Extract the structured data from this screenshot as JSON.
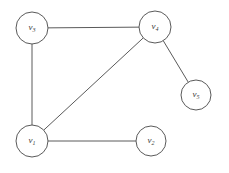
{
  "figure": {
    "type": "undirected-graph-diagram",
    "background_color": "#ffffff",
    "stroke_color": "#5a5a5a",
    "label_color": "#3a3a3a",
    "width": 229,
    "height": 173
  },
  "chart_data": {
    "type": "diagram",
    "title": "",
    "xlabel": "",
    "ylabel": "",
    "graph_kind": "undirected simple graph",
    "node_count": 5,
    "edge_count": 5,
    "nodes": [
      {
        "id": "v1",
        "label": "v",
        "subscript": "1",
        "cx": 32,
        "cy": 141,
        "r": 16
      },
      {
        "id": "v2",
        "label": "v",
        "subscript": "2",
        "cx": 151,
        "cy": 141,
        "r": 15
      },
      {
        "id": "v3",
        "label": "v",
        "subscript": "3",
        "cx": 32,
        "cy": 28,
        "r": 16
      },
      {
        "id": "v4",
        "label": "v",
        "subscript": "4",
        "cx": 155,
        "cy": 27,
        "r": 16
      },
      {
        "id": "v5",
        "label": "v",
        "subscript": "5",
        "cx": 196,
        "cy": 95,
        "r": 15
      }
    ],
    "edges": [
      {
        "source": "v3",
        "target": "v4"
      },
      {
        "source": "v3",
        "target": "v1"
      },
      {
        "source": "v1",
        "target": "v4"
      },
      {
        "source": "v1",
        "target": "v2"
      },
      {
        "source": "v4",
        "target": "v5"
      }
    ],
    "adjacency": {
      "v1": [
        "v2",
        "v3",
        "v4"
      ],
      "v2": [
        "v1"
      ],
      "v3": [
        "v1",
        "v4"
      ],
      "v4": [
        "v1",
        "v3",
        "v5"
      ],
      "v5": [
        "v4"
      ]
    },
    "degrees": {
      "v1": 3,
      "v2": 1,
      "v3": 2,
      "v4": 3,
      "v5": 1
    }
  }
}
